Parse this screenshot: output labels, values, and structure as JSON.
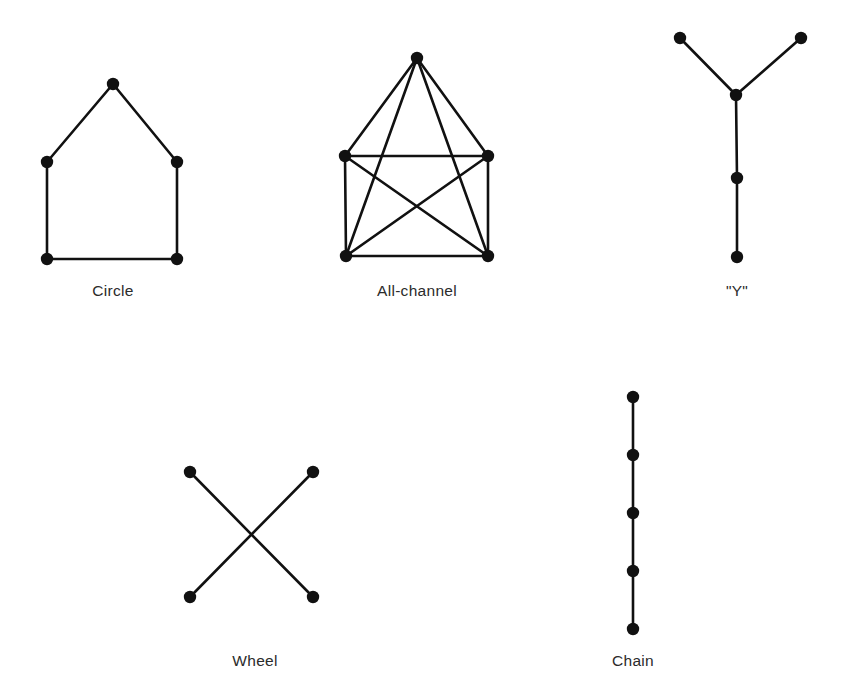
{
  "figure": {
    "background_color": "#ffffff",
    "node_color": "#111111",
    "edge_color": "#111111",
    "label_color": "#2b2b2b",
    "node_radius": 6.2,
    "edge_width": 2.6
  },
  "diagrams": [
    {
      "id": "circle",
      "label": "Circle",
      "label_x": 113,
      "label_y": 296,
      "node_count": 5,
      "nodes": [
        {
          "id": "top",
          "x": 113,
          "y": 84
        },
        {
          "id": "left-upper",
          "x": 47,
          "y": 162
        },
        {
          "id": "right-upper",
          "x": 177,
          "y": 162
        },
        {
          "id": "left-lower",
          "x": 47,
          "y": 259
        },
        {
          "id": "right-lower",
          "x": 177,
          "y": 259
        }
      ],
      "edges": [
        {
          "from": "top",
          "to": "left-upper"
        },
        {
          "from": "top",
          "to": "right-upper"
        },
        {
          "from": "left-upper",
          "to": "left-lower"
        },
        {
          "from": "right-upper",
          "to": "right-lower"
        },
        {
          "from": "left-lower",
          "to": "right-lower"
        }
      ]
    },
    {
      "id": "all-channel",
      "label": "All-channel",
      "label_x": 417,
      "label_y": 296,
      "node_count": 5,
      "nodes": [
        {
          "id": "apex",
          "x": 417,
          "y": 58
        },
        {
          "id": "left-upper",
          "x": 345,
          "y": 156
        },
        {
          "id": "right-upper",
          "x": 488,
          "y": 156
        },
        {
          "id": "left-lower",
          "x": 346,
          "y": 256
        },
        {
          "id": "right-lower",
          "x": 488,
          "y": 256
        }
      ],
      "edges": [
        {
          "from": "apex",
          "to": "left-upper"
        },
        {
          "from": "apex",
          "to": "right-upper"
        },
        {
          "from": "apex",
          "to": "left-lower"
        },
        {
          "from": "apex",
          "to": "right-lower"
        },
        {
          "from": "left-upper",
          "to": "right-upper"
        },
        {
          "from": "left-upper",
          "to": "left-lower"
        },
        {
          "from": "left-upper",
          "to": "right-lower"
        },
        {
          "from": "right-upper",
          "to": "left-lower"
        },
        {
          "from": "right-upper",
          "to": "right-lower"
        },
        {
          "from": "left-lower",
          "to": "right-lower"
        }
      ]
    },
    {
      "id": "y",
      "label": "\"Y\"",
      "label_x": 737,
      "label_y": 296,
      "node_count": 5,
      "nodes": [
        {
          "id": "branch-left",
          "x": 680,
          "y": 38
        },
        {
          "id": "branch-right",
          "x": 801,
          "y": 38
        },
        {
          "id": "junction",
          "x": 736,
          "y": 95
        },
        {
          "id": "middle",
          "x": 737,
          "y": 178
        },
        {
          "id": "bottom",
          "x": 737,
          "y": 257
        }
      ],
      "edges": [
        {
          "from": "branch-left",
          "to": "junction"
        },
        {
          "from": "branch-right",
          "to": "junction"
        },
        {
          "from": "junction",
          "to": "middle"
        },
        {
          "from": "middle",
          "to": "bottom"
        }
      ]
    },
    {
      "id": "wheel",
      "label": "Wheel",
      "label_x": 255,
      "label_y": 666,
      "node_count": 4,
      "nodes": [
        {
          "id": "top-left",
          "x": 190,
          "y": 472
        },
        {
          "id": "top-right",
          "x": 313,
          "y": 472
        },
        {
          "id": "bottom-left",
          "x": 190,
          "y": 597
        },
        {
          "id": "bottom-right",
          "x": 313,
          "y": 597
        }
      ],
      "edges": [
        {
          "from": "top-left",
          "to": "bottom-right"
        },
        {
          "from": "top-right",
          "to": "bottom-left"
        }
      ]
    },
    {
      "id": "chain",
      "label": "Chain",
      "label_x": 633,
      "label_y": 666,
      "node_count": 5,
      "nodes": [
        {
          "id": "node-1",
          "x": 633,
          "y": 397
        },
        {
          "id": "node-2",
          "x": 633,
          "y": 455
        },
        {
          "id": "node-3",
          "x": 633,
          "y": 513
        },
        {
          "id": "node-4",
          "x": 633,
          "y": 571
        },
        {
          "id": "node-5",
          "x": 633,
          "y": 629
        }
      ],
      "edges": [
        {
          "from": "node-1",
          "to": "node-2"
        },
        {
          "from": "node-2",
          "to": "node-3"
        },
        {
          "from": "node-3",
          "to": "node-4"
        },
        {
          "from": "node-4",
          "to": "node-5"
        }
      ]
    }
  ]
}
